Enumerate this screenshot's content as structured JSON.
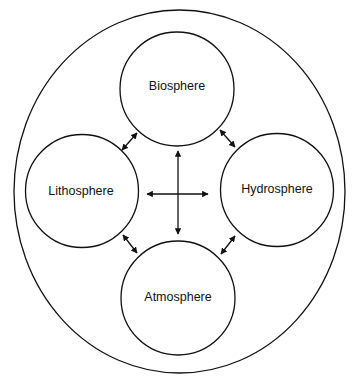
{
  "diagram": {
    "type": "earth-systems",
    "outer": {
      "label": ""
    },
    "nodes": [
      {
        "id": "biosphere",
        "label": "Biosphere"
      },
      {
        "id": "lithosphere",
        "label": "Lithosphere"
      },
      {
        "id": "hydrosphere",
        "label": "Hydrosphere"
      },
      {
        "id": "atmosphere",
        "label": "Atmosphere"
      }
    ],
    "edges": [
      {
        "from": "biosphere",
        "to": "lithosphere",
        "direction": "both"
      },
      {
        "from": "biosphere",
        "to": "hydrosphere",
        "direction": "both"
      },
      {
        "from": "lithosphere",
        "to": "atmosphere",
        "direction": "both"
      },
      {
        "from": "hydrosphere",
        "to": "atmosphere",
        "direction": "both"
      },
      {
        "from": "center",
        "to": "biosphere",
        "direction": "to"
      },
      {
        "from": "center",
        "to": "atmosphere",
        "direction": "to"
      },
      {
        "from": "center",
        "to": "lithosphere",
        "direction": "to"
      },
      {
        "from": "center",
        "to": "hydrosphere",
        "direction": "to"
      }
    ],
    "colors": {
      "stroke": "#111111",
      "background": "#ffffff"
    }
  }
}
